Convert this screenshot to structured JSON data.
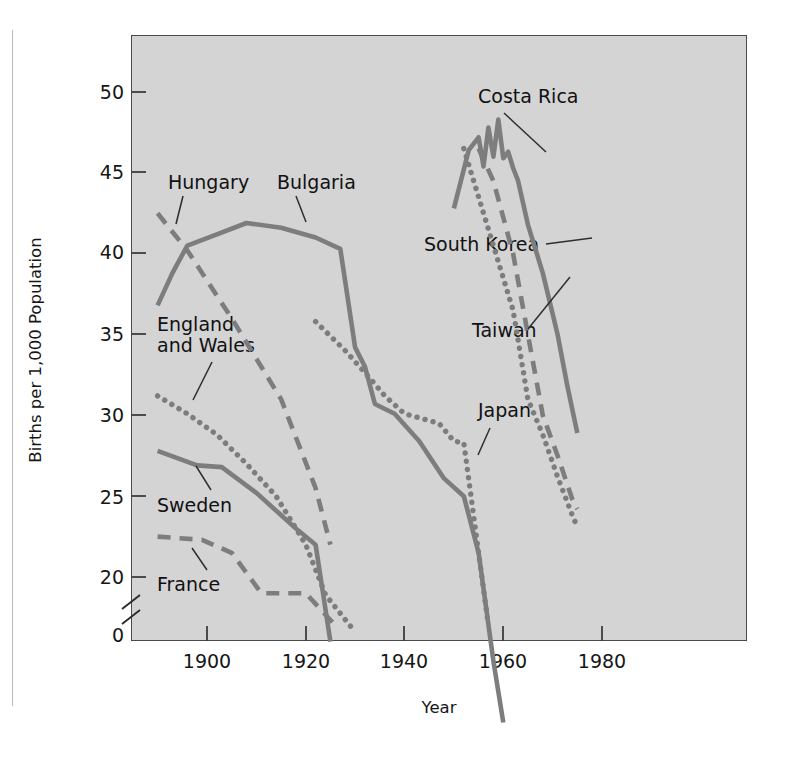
{
  "figure": {
    "background_color": "#ffffff",
    "plot_background_color": "#d4d4d4",
    "frame_color": "#4a4a4a",
    "line_color": "#7d7d7d",
    "text_color": "#161616"
  },
  "axes": {
    "y_axis_title": "Births per 1,000 Population",
    "x_axis_title": "Year",
    "y_ticks": [
      "0",
      "20",
      "25",
      "30",
      "35",
      "40",
      "45",
      "50"
    ],
    "x_ticks": [
      "1900",
      "1920",
      "1940",
      "1960",
      "1980"
    ],
    "y_axis_break": "axis-break-between-0-and-20",
    "grid": "off",
    "legend_position": "inline-labels"
  },
  "chart_data": {
    "type": "line",
    "title": "",
    "subtitle": "",
    "xlabel": "Year",
    "ylabel": "Births per 1,000 Population",
    "xlim": [
      1885,
      1985
    ],
    "ylim": [
      0,
      52.5
    ],
    "y_broken_axis": true,
    "y_break_range": [
      0,
      20
    ],
    "x_ticks": [
      1900,
      1920,
      1940,
      1960,
      1980
    ],
    "y_ticks": [
      0,
      20,
      25,
      30,
      35,
      40,
      45,
      50
    ],
    "grid": false,
    "legend": "inline-annotations",
    "series": [
      {
        "name": "Hungary",
        "style": "dashed",
        "x": [
          1890,
          1896,
          1905,
          1915,
          1922,
          1925
        ],
        "values": [
          42.5,
          40.2,
          36.0,
          31.0,
          25.5,
          22.0
        ]
      },
      {
        "name": "Bulgaria",
        "style": "solid",
        "x": [
          1890,
          1893,
          1896,
          1902,
          1908,
          1915,
          1922,
          1927,
          1930,
          1932,
          1934,
          1938,
          1943,
          1948,
          1952,
          1955,
          1958,
          1960
        ],
        "values": [
          36.8,
          38.8,
          40.5,
          41.2,
          41.9,
          41.6,
          41.0,
          40.3,
          34.2,
          33.0,
          30.7,
          30.1,
          28.4,
          26.1,
          25.0,
          21.5,
          14.8,
          11.0
        ]
      },
      {
        "name": "England and Wales",
        "style": "dotted",
        "x": [
          1890,
          1896,
          1902,
          1908,
          1914,
          1920,
          1924,
          1930
        ],
        "values": [
          31.2,
          30.1,
          28.8,
          27.0,
          25.0,
          22.0,
          18.9,
          16.6
        ]
      },
      {
        "name": "Sweden",
        "style": "solid",
        "x": [
          1890,
          1898,
          1903,
          1910,
          1918,
          1922,
          1925
        ],
        "values": [
          27.8,
          26.9,
          26.8,
          25.2,
          23.0,
          22.0,
          16.0
        ]
      },
      {
        "name": "France",
        "style": "dashed",
        "x": [
          1890,
          1899,
          1905,
          1911,
          1920,
          1926
        ],
        "values": [
          22.5,
          22.3,
          21.5,
          19.0,
          19.0,
          17.0
        ]
      },
      {
        "name": "Japan",
        "style": "dotted",
        "x": [
          1922,
          1928,
          1933,
          1936,
          1940,
          1947,
          1950,
          1952,
          1955,
          1957
        ],
        "values": [
          35.8,
          34.0,
          32.3,
          31.2,
          30.1,
          29.5,
          28.4,
          28.3,
          21.5,
          17.0
        ]
      },
      {
        "name": "Costa Rica",
        "style": "solid",
        "x": [
          1950,
          1953,
          1955,
          1956,
          1957,
          1958,
          1959,
          1960,
          1961,
          1962,
          1963,
          1965,
          1968,
          1971,
          1973,
          1975
        ],
        "values": [
          42.8,
          46.4,
          47.2,
          45.4,
          47.8,
          46.0,
          48.3,
          45.9,
          46.3,
          45.3,
          44.5,
          41.8,
          38.8,
          35.0,
          31.8,
          28.9
        ]
      },
      {
        "name": "South Korea",
        "style": "dashed",
        "x": [
          1955,
          1958,
          1962,
          1965,
          1968,
          1971,
          1974,
          1975
        ],
        "values": [
          46.5,
          44.5,
          40.0,
          35.0,
          30.0,
          27.5,
          24.8,
          24.2
        ]
      },
      {
        "name": "Taiwan",
        "style": "dotted",
        "x": [
          1952,
          1955,
          1958,
          1962,
          1965,
          1968,
          1971,
          1974,
          1975
        ],
        "values": [
          46.5,
          43.5,
          40.5,
          36.5,
          31.0,
          28.8,
          26.2,
          23.8,
          23.1
        ]
      }
    ]
  },
  "annotations": [
    {
      "name": "Hungary",
      "text": "Hungary"
    },
    {
      "name": "Bulgaria",
      "text": "Bulgaria"
    },
    {
      "name": "England and Wales",
      "text_line1": "England",
      "text_line2": "and Wales"
    },
    {
      "name": "Sweden",
      "text": "Sweden"
    },
    {
      "name": "France",
      "text": "France"
    },
    {
      "name": "Costa Rica",
      "text": "Costa Rica"
    },
    {
      "name": "South Korea",
      "text": "South Korea"
    },
    {
      "name": "Taiwan",
      "text": "Taiwan"
    },
    {
      "name": "Japan",
      "text": "Japan"
    }
  ]
}
